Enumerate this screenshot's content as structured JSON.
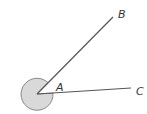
{
  "diagram": {
    "type": "angle",
    "vertex": {
      "label": "A",
      "x": 37,
      "y": 94
    },
    "rays": [
      {
        "label": "B",
        "end_x": 113,
        "end_y": 17
      },
      {
        "label": "C",
        "end_x": 131,
        "end_y": 88
      }
    ],
    "shaded_angle": "reflex angle BAC",
    "colors": {
      "line": "#555555",
      "shade": "#d9d9d9",
      "shade_stroke": "#888888"
    }
  }
}
